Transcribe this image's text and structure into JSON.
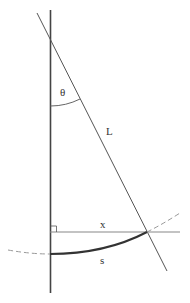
{
  "diagram": {
    "labels": {
      "theta": "θ",
      "length": "L",
      "horizontal": "x",
      "arc": "s"
    },
    "colors": {
      "line": "#333333",
      "dashed": "#9a9a9a",
      "axis": "#8a8a8a"
    },
    "elements": [
      {
        "id": "vertical-line",
        "description": "vertical reference line"
      },
      {
        "id": "pendulum-string",
        "description": "slanted line of length L at angle θ"
      },
      {
        "id": "horizontal-displacement",
        "description": "horizontal segment x with right-angle marker"
      },
      {
        "id": "arc-length",
        "description": "bold arc s along circle of radius L"
      },
      {
        "id": "circle-dashed",
        "description": "dashed continuation of circular path"
      }
    ]
  }
}
